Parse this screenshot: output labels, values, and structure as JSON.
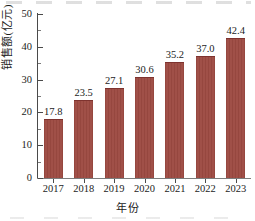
{
  "chart_data": {
    "type": "bar",
    "title": "",
    "subtitle": "",
    "xlabel": "年份",
    "ylabel": "销售额(亿元)",
    "categories": [
      "2017",
      "2018",
      "2019",
      "2020",
      "2021",
      "2022",
      "2023"
    ],
    "values": [
      17.8,
      23.5,
      27.1,
      30.6,
      35.2,
      37.0,
      42.4
    ],
    "value_labels": [
      "17.8",
      "23.5",
      "27.1",
      "30.6",
      "35.2",
      "37.0",
      "42.4"
    ],
    "series": [
      {
        "name": "销售额",
        "values": [
          17.8,
          23.5,
          27.1,
          30.6,
          35.2,
          37.0,
          42.4
        ]
      }
    ],
    "ylim": [
      0,
      50
    ],
    "xlim_categories": 7,
    "y_major_ticks": [
      0,
      10,
      20,
      30,
      40,
      50
    ],
    "y_major_tick_labels": [
      "0",
      "10",
      "20",
      "30",
      "40",
      "50"
    ],
    "y_minor_ticks": [
      5,
      15,
      25,
      35,
      45
    ],
    "grid": false,
    "legend": "none",
    "bar_color": "#9d4a42",
    "bar_edge_color": "#7e332f",
    "axis_color": "#4a4a4a",
    "text_color": "#1c1c1c",
    "background_color": "#ffffff",
    "data_labels_shown": true,
    "frame": "left-and-bottom-spines-only"
  }
}
